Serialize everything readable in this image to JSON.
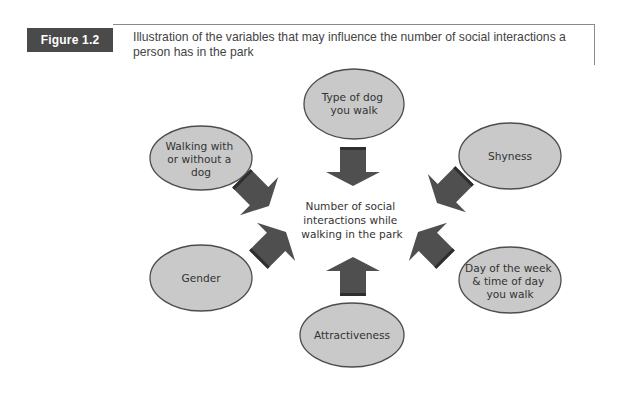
{
  "figure": {
    "label": "Figure 1.2",
    "caption_line1": "Illustration of the variables that may influence the number of social interactions a",
    "caption_line2": "person has in the park"
  },
  "diagram": {
    "center": {
      "lines": [
        "Number of social",
        "interactions while",
        "walking in the park"
      ]
    },
    "nodes": [
      {
        "id": "type-of-dog",
        "lines": [
          "Type of dog",
          "you walk"
        ]
      },
      {
        "id": "walking-with-dog",
        "lines": [
          "Walking with",
          "or without a",
          "dog"
        ]
      },
      {
        "id": "shyness",
        "lines": [
          "Shyness"
        ]
      },
      {
        "id": "gender",
        "lines": [
          "Gender"
        ]
      },
      {
        "id": "day-time",
        "lines": [
          "Day of the week",
          "& time of day",
          "you walk"
        ]
      },
      {
        "id": "attractiveness",
        "lines": [
          "Attractiveness"
        ]
      }
    ],
    "colors": {
      "node_fill": "#c9c9c9",
      "node_stroke": "#4d4d4d",
      "arrow_fill": "#4f4f4f",
      "arrow_edge": "#2e2e2e",
      "label_bg": "#4a4a4a"
    }
  }
}
